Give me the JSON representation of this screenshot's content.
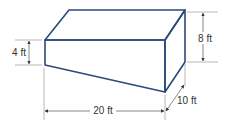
{
  "figure": {
    "colors": {
      "outline": "#2a4a7a",
      "dimension_lines": "#555555",
      "text": "#333333"
    }
  },
  "dimensions": {
    "left_height": {
      "value": 4,
      "unit": "ft",
      "label": "4 ft"
    },
    "right_height": {
      "value": 8,
      "unit": "ft",
      "label": "8 ft"
    },
    "length": {
      "value": 20,
      "unit": "ft",
      "label": "20 ft"
    },
    "depth": {
      "value": 10,
      "unit": "ft",
      "label": "10 ft"
    }
  }
}
